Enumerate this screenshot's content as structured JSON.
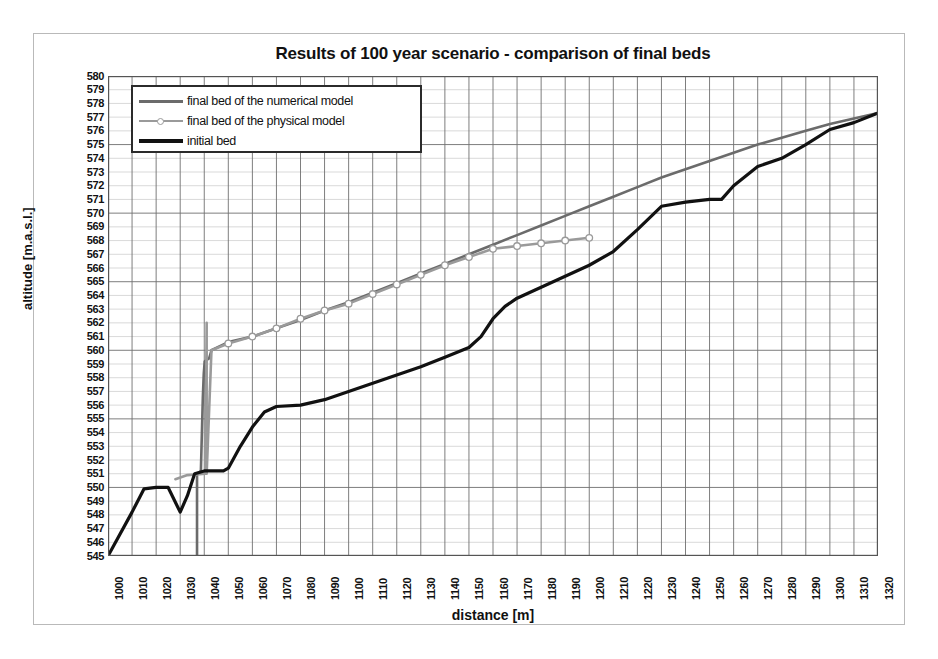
{
  "chart_data": {
    "type": "line",
    "title": "Results of 100 year scenario - comparison of final beds",
    "xlabel": "distance [m]",
    "ylabel": "altitude [m.a.s.l.]",
    "xlim": [
      1000,
      1320
    ],
    "ylim": [
      545,
      580
    ],
    "xtick_step": 10,
    "ytick_step": 1,
    "grid": true,
    "legend_position": "top-left inside plot",
    "xticks": [
      1000,
      1010,
      1020,
      1030,
      1040,
      1050,
      1060,
      1070,
      1080,
      1090,
      1100,
      1110,
      1120,
      1130,
      1140,
      1150,
      1160,
      1170,
      1180,
      1190,
      1200,
      1210,
      1220,
      1230,
      1240,
      1250,
      1260,
      1270,
      1280,
      1290,
      1300,
      1310,
      1320
    ],
    "yticks": [
      545,
      546,
      547,
      548,
      549,
      550,
      551,
      552,
      553,
      554,
      555,
      556,
      557,
      558,
      559,
      560,
      561,
      562,
      563,
      564,
      565,
      566,
      567,
      568,
      569,
      570,
      571,
      572,
      573,
      574,
      575,
      576,
      577,
      578,
      579,
      580
    ],
    "series": [
      {
        "name": "final bed of the numerical model",
        "color": "#6b6b6b",
        "width": 2.6,
        "marker": "none",
        "points": [
          [
            1037.0,
            545.0
          ],
          [
            1037.0,
            551.0
          ],
          [
            1038.6,
            551.2
          ],
          [
            1039.4,
            556.5
          ],
          [
            1039.8,
            558.3
          ],
          [
            1040.2,
            559.2
          ],
          [
            1042.0,
            559.4
          ],
          [
            1043.0,
            560.0
          ],
          [
            1050.0,
            560.6
          ],
          [
            1060.0,
            561.0
          ],
          [
            1070.0,
            561.6
          ],
          [
            1080.0,
            562.2
          ],
          [
            1090.0,
            562.9
          ],
          [
            1100.0,
            563.5
          ],
          [
            1110.0,
            564.2
          ],
          [
            1120.0,
            564.9
          ],
          [
            1130.0,
            565.6
          ],
          [
            1140.0,
            566.3
          ],
          [
            1150.0,
            567.0
          ],
          [
            1160.0,
            567.7
          ],
          [
            1170.0,
            568.4
          ],
          [
            1180.0,
            569.1
          ],
          [
            1190.0,
            569.8
          ],
          [
            1200.0,
            570.5
          ],
          [
            1210.0,
            571.2
          ],
          [
            1220.0,
            571.9
          ],
          [
            1230.0,
            572.6
          ],
          [
            1240.0,
            573.2
          ],
          [
            1250.0,
            573.8
          ],
          [
            1260.0,
            574.4
          ],
          [
            1270.0,
            575.0
          ],
          [
            1280.0,
            575.5
          ],
          [
            1290.0,
            576.0
          ],
          [
            1300.0,
            576.5
          ],
          [
            1310.0,
            576.9
          ],
          [
            1320.0,
            577.3
          ]
        ]
      },
      {
        "name": "final bed of the physical model",
        "color": "#9a9a9a",
        "width": 2.6,
        "marker": "circle",
        "points": [
          [
            1028.0,
            550.6
          ],
          [
            1033.0,
            550.9
          ],
          [
            1040.5,
            551.0
          ],
          [
            1041.0,
            562.0
          ],
          [
            1041.0,
            551.0
          ],
          [
            1043.0,
            560.0
          ],
          [
            1050.0,
            560.5
          ],
          [
            1060.0,
            561.0
          ],
          [
            1070.0,
            561.6
          ],
          [
            1080.0,
            562.3
          ],
          [
            1090.0,
            562.9
          ],
          [
            1100.0,
            563.4
          ],
          [
            1110.0,
            564.1
          ],
          [
            1120.0,
            564.8
          ],
          [
            1130.0,
            565.5
          ],
          [
            1140.0,
            566.2
          ],
          [
            1150.0,
            566.8
          ],
          [
            1160.0,
            567.4
          ],
          [
            1170.0,
            567.6
          ],
          [
            1180.0,
            567.8
          ],
          [
            1190.0,
            568.0
          ],
          [
            1200.0,
            568.2
          ]
        ],
        "marker_points": [
          [
            1050.0,
            560.5
          ],
          [
            1060.0,
            561.0
          ],
          [
            1070.0,
            561.6
          ],
          [
            1080.0,
            562.3
          ],
          [
            1090.0,
            562.9
          ],
          [
            1100.0,
            563.4
          ],
          [
            1110.0,
            564.1
          ],
          [
            1120.0,
            564.8
          ],
          [
            1130.0,
            565.5
          ],
          [
            1140.0,
            566.2
          ],
          [
            1150.0,
            566.8
          ],
          [
            1160.0,
            567.4
          ],
          [
            1170.0,
            567.6
          ],
          [
            1180.0,
            567.8
          ],
          [
            1190.0,
            568.0
          ],
          [
            1200.0,
            568.2
          ]
        ]
      },
      {
        "name": "initial bed",
        "color": "#111111",
        "width": 3.2,
        "marker": "none",
        "points": [
          [
            1000.0,
            545.0
          ],
          [
            1010.0,
            548.2
          ],
          [
            1015.0,
            549.9
          ],
          [
            1020.0,
            550.0
          ],
          [
            1025.0,
            550.0
          ],
          [
            1030.0,
            548.2
          ],
          [
            1033.0,
            549.4
          ],
          [
            1036.0,
            551.0
          ],
          [
            1040.0,
            551.2
          ],
          [
            1043.0,
            551.2
          ],
          [
            1048.0,
            551.2
          ],
          [
            1050.0,
            551.4
          ],
          [
            1055.0,
            553.0
          ],
          [
            1060.0,
            554.4
          ],
          [
            1065.0,
            555.5
          ],
          [
            1070.0,
            555.9
          ],
          [
            1080.0,
            556.0
          ],
          [
            1090.0,
            556.4
          ],
          [
            1100.0,
            557.0
          ],
          [
            1110.0,
            557.6
          ],
          [
            1120.0,
            558.2
          ],
          [
            1130.0,
            558.8
          ],
          [
            1140.0,
            559.5
          ],
          [
            1150.0,
            560.2
          ],
          [
            1155.0,
            561.0
          ],
          [
            1160.0,
            562.3
          ],
          [
            1165.0,
            563.2
          ],
          [
            1170.0,
            563.8
          ],
          [
            1180.0,
            564.6
          ],
          [
            1190.0,
            565.4
          ],
          [
            1200.0,
            566.2
          ],
          [
            1210.0,
            567.2
          ],
          [
            1220.0,
            568.8
          ],
          [
            1230.0,
            570.5
          ],
          [
            1240.0,
            570.8
          ],
          [
            1250.0,
            571.0
          ],
          [
            1255.0,
            571.0
          ],
          [
            1260.0,
            572.0
          ],
          [
            1270.0,
            573.4
          ],
          [
            1280.0,
            574.0
          ],
          [
            1290.0,
            575.0
          ],
          [
            1300.0,
            576.1
          ],
          [
            1310.0,
            576.6
          ],
          [
            1320.0,
            577.3
          ]
        ]
      }
    ]
  },
  "legend": {
    "items": [
      {
        "label": "final bed of the numerical model",
        "color": "#6b6b6b",
        "marker": "none",
        "width": 3
      },
      {
        "label": "final bed of the physical model",
        "color": "#9a9a9a",
        "marker": "circle",
        "width": 2
      },
      {
        "label": "initial bed",
        "color": "#111111",
        "marker": "none",
        "width": 4
      }
    ]
  },
  "axes": {
    "grid_major_color": "#6f6f6f",
    "grid_minor_color": "#c8c8c8",
    "frame_color": "#555555"
  }
}
